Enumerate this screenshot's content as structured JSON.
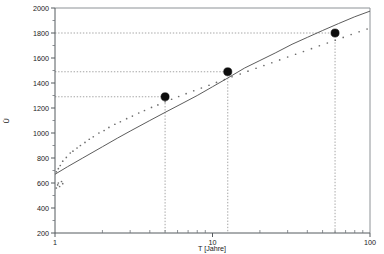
{
  "chart_data": {
    "type": "line",
    "title": "",
    "xlabel": "T [Jahre]",
    "ylabel": "Ü",
    "xscale": "log",
    "yscale": "linear",
    "xlim": [
      1,
      100
    ],
    "ylim": [
      200,
      2000
    ],
    "grid": false,
    "legend": "none",
    "xticks": [
      1,
      10,
      100
    ],
    "xticklabels": [
      "1",
      "10",
      "100"
    ],
    "yticks": [
      200,
      400,
      600,
      800,
      1000,
      1200,
      1400,
      1600,
      1800,
      2000
    ],
    "yticklabels": [
      "200",
      "400",
      "600",
      "800",
      "1000",
      "1200",
      "1400",
      "1600",
      "1800",
      "2000"
    ],
    "series": [
      {
        "name": "fit-curve",
        "style": "solid-line",
        "x": [
          1,
          1.2,
          1.5,
          2,
          2.5,
          3,
          4,
          5,
          6.5,
          8,
          10,
          12.5,
          16,
          20,
          25,
          32,
          40,
          50,
          63,
          80,
          100
        ],
        "y": [
          670,
          730,
          800,
          890,
          960,
          1015,
          1100,
          1165,
          1240,
          1300,
          1370,
          1440,
          1520,
          1580,
          1640,
          1710,
          1765,
          1820,
          1875,
          1930,
          1975
        ]
      },
      {
        "name": "scatter-measurements",
        "style": "dots",
        "x": [
          1.02,
          1.05,
          1.08,
          1.12,
          1.18,
          1.25,
          1.3,
          1.38,
          1.45,
          1.55,
          1.65,
          1.75,
          1.9,
          2.05,
          2.2,
          2.4,
          2.6,
          2.85,
          3.1,
          3.4,
          3.7,
          4.1,
          4.5,
          5.0,
          5.5,
          6.1,
          6.8,
          7.6,
          8.5,
          9.5,
          10.6,
          11.9,
          13.3,
          15.0,
          16.8,
          18.9,
          21.2,
          23.8,
          26.7,
          30.0,
          33.7,
          37.8,
          42.5,
          47.7,
          53.6,
          60.2,
          67.6,
          75.9,
          85.3,
          95.8
        ],
        "y": [
          690,
          715,
          740,
          775,
          805,
          840,
          855,
          880,
          900,
          925,
          950,
          970,
          1000,
          1020,
          1045,
          1070,
          1090,
          1115,
          1135,
          1160,
          1180,
          1205,
          1225,
          1250,
          1270,
          1292,
          1315,
          1338,
          1360,
          1382,
          1405,
          1428,
          1450,
          1472,
          1495,
          1518,
          1540,
          1562,
          1585,
          1608,
          1630,
          1652,
          1675,
          1698,
          1720,
          1742,
          1765,
          1788,
          1810,
          1832
        ]
      },
      {
        "name": "scatter-outliers-low",
        "style": "dots",
        "x": [
          1.02,
          1.04,
          1.05,
          1.07,
          1.1,
          1.12
        ],
        "y": [
          560,
          585,
          600,
          572,
          612,
          595
        ]
      }
    ],
    "highlight_points": [
      {
        "label": "point-1",
        "x": 5,
        "y": 1290
      },
      {
        "label": "point-2",
        "x": 12.5,
        "y": 1490
      },
      {
        "label": "point-3",
        "x": 60,
        "y": 1800
      }
    ],
    "guide_lines": {
      "horizontal_y": [
        1290,
        1490,
        1800
      ],
      "vertical_x": [
        5,
        12.5,
        60
      ]
    }
  }
}
